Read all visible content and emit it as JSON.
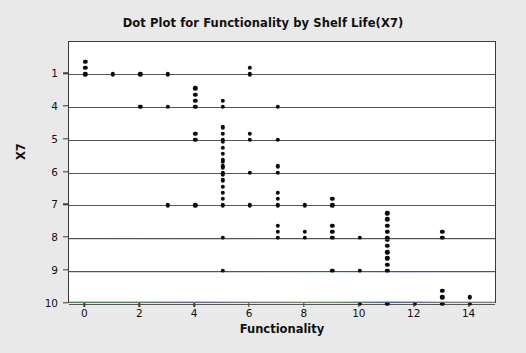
{
  "chart_data": {
    "type": "scatter",
    "title": "Dot Plot for Functionality by Shelf Life(X7)",
    "xlabel": "Functionality",
    "ylabel": "X7",
    "xlim": [
      -0.6,
      15.0
    ],
    "x_ticks": [
      0,
      2,
      4,
      6,
      8,
      10,
      12,
      14
    ],
    "y_categories": [
      1,
      4,
      5,
      6,
      7,
      8,
      9,
      10
    ],
    "y_tick_labels": [
      "1",
      "4",
      "5",
      "6",
      "7",
      "8",
      "9",
      "10"
    ],
    "grid": true,
    "legend": "none",
    "marker": "filled-circle",
    "marker_color": "#0b0b0b",
    "plot_background": "#ffffff",
    "figure_background": "#e9e9e9",
    "rows": [
      {
        "category": 1,
        "points": [
          {
            "x": 0,
            "count": 3
          },
          {
            "x": 1,
            "count": 1
          },
          {
            "x": 2,
            "count": 1
          },
          {
            "x": 3,
            "count": 1
          },
          {
            "x": 6,
            "count": 2
          }
        ]
      },
      {
        "category": 4,
        "points": [
          {
            "x": 2,
            "count": 1
          },
          {
            "x": 3,
            "count": 1
          },
          {
            "x": 4,
            "count": 4
          },
          {
            "x": 5,
            "count": 2
          },
          {
            "x": 7,
            "count": 1
          }
        ]
      },
      {
        "category": 5,
        "points": [
          {
            "x": 4,
            "count": 2
          },
          {
            "x": 5,
            "count": 3
          },
          {
            "x": 6,
            "count": 2
          },
          {
            "x": 7,
            "count": 1
          }
        ]
      },
      {
        "category": 6,
        "points": [
          {
            "x": 5,
            "count": 6
          },
          {
            "x": 6,
            "count": 1
          },
          {
            "x": 7,
            "count": 2
          }
        ]
      },
      {
        "category": 7,
        "points": [
          {
            "x": 3,
            "count": 1
          },
          {
            "x": 4,
            "count": 1
          },
          {
            "x": 5,
            "count": 8
          },
          {
            "x": 6,
            "count": 1
          },
          {
            "x": 7,
            "count": 3
          },
          {
            "x": 8,
            "count": 1
          },
          {
            "x": 9,
            "count": 2
          }
        ]
      },
      {
        "category": 8,
        "points": [
          {
            "x": 5,
            "count": 1
          },
          {
            "x": 7,
            "count": 3
          },
          {
            "x": 8,
            "count": 2
          },
          {
            "x": 9,
            "count": 3
          },
          {
            "x": 10,
            "count": 1
          },
          {
            "x": 11,
            "count": 5
          },
          {
            "x": 13,
            "count": 2
          }
        ]
      },
      {
        "category": 9,
        "points": [
          {
            "x": 5,
            "count": 1
          },
          {
            "x": 9,
            "count": 1
          },
          {
            "x": 10,
            "count": 1
          },
          {
            "x": 11,
            "count": 6
          }
        ]
      },
      {
        "category": 10,
        "points": [
          {
            "x": 10,
            "count": 1
          },
          {
            "x": 11,
            "count": 1
          },
          {
            "x": 12,
            "count": 1
          },
          {
            "x": 13,
            "count": 3
          },
          {
            "x": 14,
            "count": 2
          }
        ]
      }
    ]
  }
}
